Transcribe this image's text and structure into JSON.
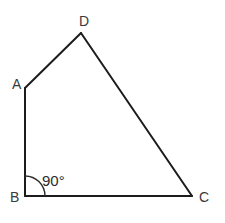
{
  "figure": {
    "shape_type": "quadrilateral",
    "stroke_color": "#1c1c1c",
    "label_color": "#3a3a3a",
    "background_color": "#ffffff",
    "vertices": [
      {
        "id": "A",
        "label": "A",
        "x": 25,
        "y": 88,
        "label_x": 12,
        "label_y": 89
      },
      {
        "id": "D",
        "label": "D",
        "x": 81,
        "y": 33,
        "label_x": 79,
        "label_y": 26
      },
      {
        "id": "C",
        "label": "C",
        "x": 192,
        "y": 196,
        "label_x": 199,
        "label_y": 202
      },
      {
        "id": "B",
        "label": "B",
        "x": 25,
        "y": 196,
        "label_x": 10,
        "label_y": 202
      }
    ],
    "edges": [
      {
        "from": "A",
        "to": "D"
      },
      {
        "from": "D",
        "to": "C"
      },
      {
        "from": "C",
        "to": "B"
      },
      {
        "from": "B",
        "to": "A"
      }
    ],
    "angle_marks": [
      {
        "at_vertex": "B",
        "value": "90°",
        "label_x": 42,
        "label_y": 186,
        "arc_radius": 20,
        "arc_path": "M 25 176 A 20 20 0 0 1 45 196"
      }
    ]
  }
}
